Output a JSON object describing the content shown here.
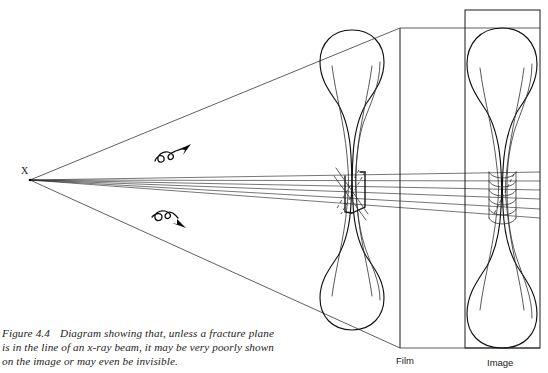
{
  "figure": {
    "number": "Figure 4.4",
    "caption_text": "Diagram showing that, unless a fracture plane is in the line of an x-ray beam, it may be very poorly shown on the image or may even be invisible.",
    "domain_type": "radiography-schematic"
  },
  "labels": {
    "source": "X",
    "film": "Film",
    "image": "Image"
  },
  "annotations": {
    "upper_symbol": "wave-arrow-up-right",
    "lower_symbol": "wave-arrow-down-right"
  },
  "colors": {
    "ink": "#111111",
    "ray": "#2b2b2b",
    "background": "#ffffff",
    "faint": "#3d3d3d"
  },
  "geometry": {
    "source_point": {
      "x": 30,
      "y": 180
    },
    "film_plane": {
      "x": 400,
      "y_top": 28,
      "y_bottom": 348
    },
    "image_frame": {
      "x": 465,
      "y": 10,
      "width": 75,
      "height": 338
    },
    "beam_cone": {
      "apex": {
        "x": 30,
        "y": 180
      },
      "top_end": {
        "x": 400,
        "y": 28
      },
      "bottom_end": {
        "x": 400,
        "y": 348
      }
    },
    "object_bone": {
      "center_x": 352,
      "top_y": 30,
      "bottom_y": 330
    },
    "image_bone": {
      "center_x": 502,
      "top_y": 28,
      "bottom_y": 348
    },
    "fracture_zone": {
      "y_top": 172,
      "y_bottom": 218
    },
    "ray_count": 6
  }
}
